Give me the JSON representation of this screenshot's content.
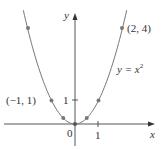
{
  "chart_data": {
    "type": "line",
    "title": "",
    "function_label": "y = x^2",
    "xlabel": "x",
    "ylabel": "y",
    "x_ticks": [
      {
        "value": 1,
        "label": "1"
      }
    ],
    "y_ticks": [
      {
        "value": 1,
        "label": "1"
      }
    ],
    "origin_label": "0",
    "xlim": [
      -3.2,
      3.5
    ],
    "ylim": [
      -0.5,
      5.2
    ],
    "grid": false,
    "series": [
      {
        "name": "y = x^2",
        "x": [
          -2.2,
          -2,
          -1.5,
          -1,
          -0.5,
          0,
          0.5,
          1,
          1.5,
          2,
          2.2
        ],
        "y": [
          4.84,
          4,
          2.25,
          1,
          0.25,
          0,
          0.25,
          1,
          2.25,
          4,
          4.84
        ]
      }
    ],
    "points": [
      {
        "x": -2,
        "y": 4
      },
      {
        "x": -1,
        "y": 1
      },
      {
        "x": -0.5,
        "y": 0.25
      },
      {
        "x": 0,
        "y": 0
      },
      {
        "x": 0.5,
        "y": 0.25
      },
      {
        "x": 1,
        "y": 1
      },
      {
        "x": 2,
        "y": 4
      }
    ],
    "annotations": [
      {
        "text": "(2, 4)",
        "x": 2,
        "y": 4
      },
      {
        "text": "(−1, 1)",
        "x": -1,
        "y": 1
      }
    ]
  },
  "labels": {
    "x_axis": "x",
    "y_axis": "y",
    "origin": "0",
    "x_tick_1": "1",
    "y_tick_1": "1",
    "point_2_4": "(2, 4)",
    "point_m1_1": "(−1, 1)",
    "eq_prefix": "y = x",
    "eq_exp": "2"
  }
}
